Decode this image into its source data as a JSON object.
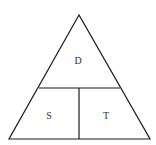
{
  "diagram": {
    "type": "formula-triangle",
    "top_label": "D",
    "bottom_left_label": "S",
    "bottom_right_label": "T",
    "stroke_color": "#1a1a1a",
    "background_color": "#ffffff"
  }
}
